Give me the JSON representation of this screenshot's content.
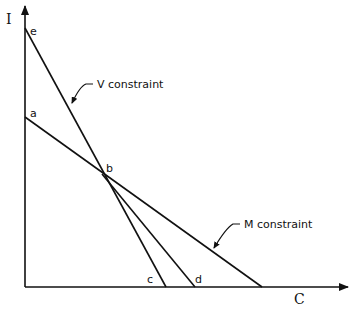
{
  "axes": {
    "y_label": "I",
    "x_label": "C"
  },
  "points": {
    "a": "a",
    "b": "b",
    "c": "c",
    "d": "d",
    "e": "e"
  },
  "annotations": {
    "v_constraint": "V constraint",
    "m_constraint": "M constraint"
  },
  "colors": {
    "ink": "#111111",
    "background": "#ffffff"
  }
}
